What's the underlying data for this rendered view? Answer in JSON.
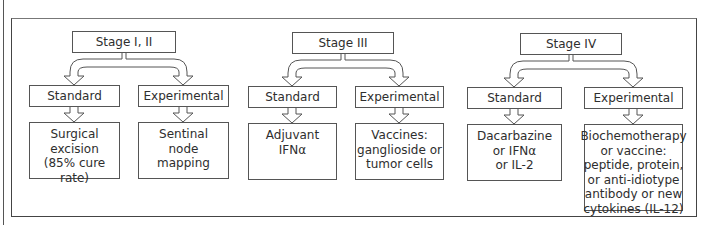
{
  "diagram": {
    "columns": [
      {
        "stage": "Stage I, II",
        "standard": {
          "label": "Standard",
          "treatment": "Surgical\nexcision\n(85% cure rate)"
        },
        "experimental": {
          "label": "Experimental",
          "treatment": "Sentinal\nnode\nmapping"
        }
      },
      {
        "stage": "Stage III",
        "standard": {
          "label": "Standard",
          "treatment": "Adjuvant\nIFNα"
        },
        "experimental": {
          "label": "Experimental",
          "treatment": "Vaccines:\nganglioside or\ntumor cells"
        }
      },
      {
        "stage": "Stage IV",
        "standard": {
          "label": "Standard",
          "treatment": "Dacarbazine\nor IFNα\nor IL-2"
        },
        "experimental": {
          "label": "Experimental",
          "treatment": "Biochemotherapy\nor vaccine:\npeptide, protein,\nor anti-idiotype\nantibody or new\ncytokines (IL-12)"
        }
      }
    ]
  }
}
